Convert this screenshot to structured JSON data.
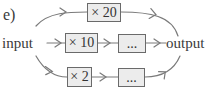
{
  "diagram": {
    "part_label": "e)",
    "input_label": "input",
    "output_label": "output",
    "paths": [
      {
        "name": "top",
        "boxes": [
          {
            "label": "× 20"
          }
        ]
      },
      {
        "name": "middle",
        "boxes": [
          {
            "label": "× 10"
          },
          {
            "label": "..."
          }
        ]
      },
      {
        "name": "bottom",
        "boxes": [
          {
            "label": "× 2"
          },
          {
            "label": "..."
          }
        ]
      }
    ],
    "colors": {
      "stroke": "#7a7a7a",
      "box_fill": "#ececec",
      "box_border": "#6a6a6a",
      "text": "#3a3a3a"
    }
  }
}
